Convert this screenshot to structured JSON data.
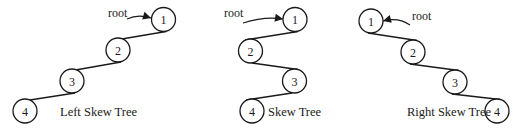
{
  "colors": {
    "stroke": "#1a1a1a",
    "background": "#ffffff",
    "node_fill": "#ffffff"
  },
  "node_radius": 12,
  "trees": [
    {
      "id": "left-skew-tree",
      "caption": "Left Skew Tree",
      "caption_pos": [
        60,
        116
      ],
      "root_label": "root",
      "root_label_pos": [
        108,
        17
      ],
      "root_arrow": {
        "from": [
          127,
          19
        ],
        "ctrl": [
          138,
          14
        ],
        "to": [
          151,
          18
        ]
      },
      "nodes": [
        {
          "label": "1",
          "cx": 163.5,
          "cy": 19.5
        },
        {
          "label": "2",
          "cx": 118,
          "cy": 50
        },
        {
          "label": "3",
          "cx": 72,
          "cy": 81
        },
        {
          "label": "4",
          "cx": 25,
          "cy": 111
        }
      ],
      "edges": [
        {
          "from": [
            166,
            31.5
          ],
          "to": [
            110,
            41
          ]
        },
        {
          "from": [
            121,
            62
          ],
          "to": [
            64,
            72
          ]
        },
        {
          "from": [
            75,
            93
          ],
          "to": [
            17,
            102
          ]
        }
      ]
    },
    {
      "id": "skew-tree",
      "caption": "Skew Tree",
      "caption_pos": [
        268,
        116
      ],
      "root_label": "root",
      "root_label_pos": [
        224,
        17
      ],
      "root_arrow": {
        "from": [
          243,
          23
        ],
        "ctrl": [
          265,
          16
        ],
        "to": [
          283,
          19
        ]
      },
      "nodes": [
        {
          "label": "1",
          "cx": 295,
          "cy": 19.5
        },
        {
          "label": "2",
          "cx": 250.5,
          "cy": 51
        },
        {
          "label": "3",
          "cx": 294.5,
          "cy": 81
        },
        {
          "label": "4",
          "cx": 252,
          "cy": 111
        }
      ],
      "edges": [
        {
          "from": [
            298,
            31.5
          ],
          "to": [
            245,
            40
          ]
        },
        {
          "from": [
            252,
            63
          ],
          "to": [
            298,
            69.5
          ]
        },
        {
          "from": [
            292,
            93
          ],
          "to": [
            246,
            100
          ]
        }
      ]
    },
    {
      "id": "right-skew-tree",
      "caption": "Right Skew Tree",
      "caption_pos": [
        407,
        116
      ],
      "root_label": "root",
      "root_label_pos": [
        412,
        20
      ],
      "root_arrow": {
        "from": [
          410,
          25
        ],
        "ctrl": [
          398,
          17
        ],
        "to": [
          383,
          21
        ]
      },
      "nodes": [
        {
          "label": "1",
          "cx": 371,
          "cy": 21
        },
        {
          "label": "2",
          "cx": 413,
          "cy": 52
        },
        {
          "label": "3",
          "cx": 455,
          "cy": 82
        },
        {
          "label": "4",
          "cx": 497,
          "cy": 111
        }
      ],
      "edges": [
        {
          "from": [
            368,
            33
          ],
          "to": [
            417,
            40.5
          ]
        },
        {
          "from": [
            410,
            64
          ],
          "to": [
            459,
            70.5
          ]
        },
        {
          "from": [
            452,
            94
          ],
          "to": [
            500,
            99.5
          ]
        }
      ]
    }
  ]
}
